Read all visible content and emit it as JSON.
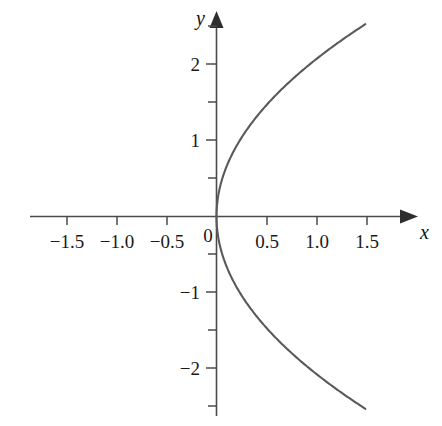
{
  "figure": {
    "background_color": "#ffffff",
    "curve_color": "#5a5a5a",
    "axis_color": "#4a4a4a",
    "text_color": "#1a1a1a"
  },
  "axes": {
    "x_name": "x",
    "y_name": "y",
    "origin_label": "0"
  },
  "chart_data": {
    "type": "line",
    "title": "",
    "subtitle": "",
    "xlabel": "x",
    "ylabel": "y",
    "xlim": [
      -1.85,
      1.85
    ],
    "ylim": [
      -2.75,
      2.75
    ],
    "grid": false,
    "legend": false,
    "legend_position": "none",
    "annotations": [],
    "equation": "x = y^2 / 4.3  (sideways parabola opening right, vertex at origin)",
    "x_ticks_major": [
      -1.5,
      -1.0,
      -0.5,
      0,
      0.5,
      1.0,
      1.5
    ],
    "x_tick_labels": [
      "−1.5",
      "−1.0",
      "−0.5",
      "0",
      "0.5",
      "1.0",
      "1.5"
    ],
    "x_ticks_minor": [
      -1.75,
      -1.25,
      -0.75,
      -0.25,
      0.25,
      0.75,
      1.25,
      1.75
    ],
    "y_ticks_major": [
      2,
      1,
      -1,
      -2
    ],
    "y_tick_labels": [
      "2",
      "1",
      "−1",
      "−2"
    ],
    "y_ticks_minor": [
      2.5,
      1.5,
      0.5,
      -0.5,
      -1.5,
      -2.5
    ],
    "series": [
      {
        "name": "upper branch",
        "x": [
          0,
          0.006,
          0.023,
          0.052,
          0.093,
          0.145,
          0.209,
          0.285,
          0.372,
          0.471,
          0.581,
          0.703,
          0.837,
          0.982,
          1.139,
          1.308,
          1.488
        ],
        "y": [
          0,
          0.16,
          0.32,
          0.47,
          0.63,
          0.79,
          0.95,
          1.11,
          1.27,
          1.42,
          1.58,
          1.74,
          1.9,
          2.06,
          2.21,
          2.37,
          2.53
        ]
      },
      {
        "name": "lower branch",
        "x": [
          0,
          0.006,
          0.023,
          0.052,
          0.093,
          0.145,
          0.209,
          0.285,
          0.372,
          0.471,
          0.581,
          0.703,
          0.837,
          0.982,
          1.139,
          1.308,
          1.488
        ],
        "y": [
          0,
          -0.16,
          -0.32,
          -0.47,
          -0.63,
          -0.79,
          -0.95,
          -1.11,
          -1.27,
          -1.42,
          -1.58,
          -1.74,
          -1.9,
          -2.06,
          -2.21,
          -2.37,
          -2.53
        ]
      }
    ]
  }
}
